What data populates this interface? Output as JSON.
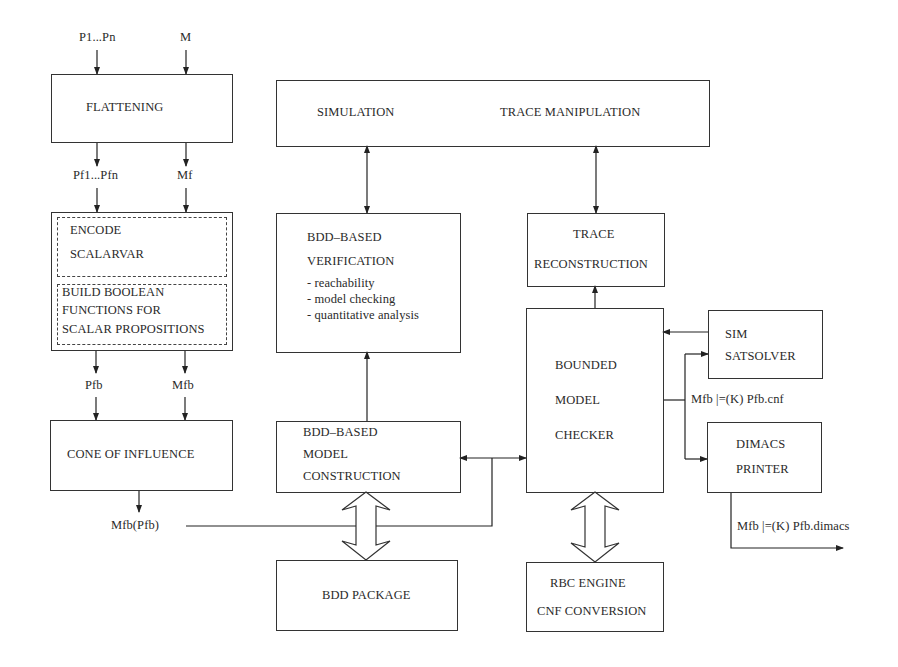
{
  "inputs": {
    "props": "P1...Pn",
    "model": "M"
  },
  "flattening": {
    "label": "FLATTENING"
  },
  "flattened": {
    "props": "Pf1...Pfn",
    "model": "Mf"
  },
  "encode": {
    "part1": [
      "ENCODE",
      "SCALARVAR"
    ],
    "part2": [
      "BUILD BOOLEAN",
      "FUNCTIONS FOR",
      "SCALAR PROPOSITIONS"
    ]
  },
  "boolean": {
    "props": "Pfb",
    "model": "Mfb"
  },
  "coi": {
    "label": "CONE OF INFLUENCE"
  },
  "coi_output": "Mfb(Pfb)",
  "simulation": {
    "left": "SIMULATION",
    "right": "TRACE MANIPULATION"
  },
  "bdd_verification": {
    "title": [
      "BDD–BASED",
      "VERIFICATION"
    ],
    "items": [
      "- reachability",
      "- model checking",
      "- quantitative analysis"
    ]
  },
  "trace_reconstruction": [
    "TRACE",
    "RECONSTRUCTION"
  ],
  "bmc": [
    "BOUNDED",
    "MODEL",
    "CHECKER"
  ],
  "sat_solver": [
    "SIM",
    "SATSOLVER"
  ],
  "cnf_label": "Mfb |=(K) Pfb.cnf",
  "dimacs": [
    "DIMACS",
    "PRINTER"
  ],
  "dimacs_label": "Mfb |=(K) Pfb.dimacs",
  "bdd_model_construction": [
    "BDD–BASED",
    "MODEL",
    "CONSTRUCTION"
  ],
  "bdd_package": "BDD PACKAGE",
  "rbc": [
    "RBC ENGINE",
    "CNF CONVERSION"
  ]
}
